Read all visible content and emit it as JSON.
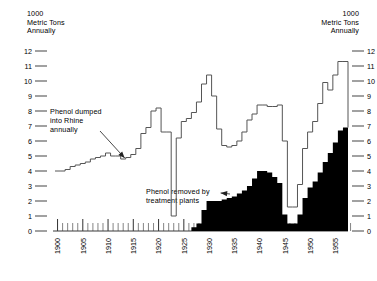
{
  "axis_caption_left": "1000\nMetric Tons\nAnnually",
  "axis_caption_right": "1000\nMetric Tons\nAnnually",
  "annotation_dumped": "Phenol dumped\ninto Rhine\nannually",
  "annotation_removed": "Phenol removed by\ntreatment plants",
  "colors": {
    "line": "#555555",
    "area_fill": "#000000",
    "text": "#000000",
    "tick": "#555555",
    "background": "#ffffff"
  },
  "chart_data": {
    "type": "area",
    "title": "",
    "subtitle": "",
    "xlabel": "",
    "ylabel": "1000 Metric Tons Annually",
    "xlim": [
      1900,
      1958
    ],
    "ylim": [
      0,
      12
    ],
    "grid": false,
    "legend": "none",
    "y_ticks": [
      12,
      11,
      10,
      9,
      8,
      7,
      6,
      5,
      4,
      3,
      2,
      1,
      0
    ],
    "y_tick_labels_left": [
      "12",
      "11",
      "10",
      "9",
      "8",
      "7",
      "6",
      "5",
      "4",
      "3",
      "2",
      "1",
      "0"
    ],
    "y_tick_labels_right": [
      "12",
      "11",
      "10",
      "9",
      "8",
      "7",
      "6",
      "5",
      "4",
      "3",
      "2",
      "1",
      "0"
    ],
    "x_ticks_major": [
      1900,
      1905,
      1910,
      1915,
      1920,
      1925,
      1930,
      1935,
      1940,
      1945,
      1950,
      1955
    ],
    "x_tick_labels": [
      "1900",
      "1905",
      "1910",
      "1915",
      "1920",
      "1925",
      "1930",
      "1935",
      "1940",
      "1945",
      "1950",
      "1955"
    ],
    "x_ticks_minor_step": 1,
    "annotations": [
      {
        "text": "Phenol dumped\ninto Rhine\nannually",
        "points_to_year": 1913,
        "points_to_value": 4.8
      },
      {
        "text": "Phenol removed by\ntreatment plants",
        "points_to_year": 1932,
        "points_to_value": 2.6
      }
    ],
    "x": [
      1900,
      1901,
      1902,
      1903,
      1904,
      1905,
      1906,
      1907,
      1908,
      1909,
      1910,
      1911,
      1912,
      1913,
      1914,
      1915,
      1916,
      1917,
      1918,
      1919,
      1920,
      1921,
      1922,
      1923,
      1924,
      1925,
      1926,
      1927,
      1928,
      1929,
      1930,
      1931,
      1932,
      1933,
      1934,
      1935,
      1936,
      1937,
      1938,
      1939,
      1940,
      1941,
      1942,
      1943,
      1944,
      1945,
      1946,
      1947,
      1948,
      1949,
      1950,
      1951,
      1952,
      1953,
      1954,
      1955,
      1956,
      1957
    ],
    "series": [
      {
        "name": "Phenol dumped into Rhine annually",
        "style": "step-line",
        "values": [
          4.0,
          4.0,
          4.1,
          4.3,
          4.4,
          4.5,
          4.6,
          4.8,
          4.9,
          5.0,
          5.2,
          5.0,
          5.0,
          4.8,
          4.9,
          5.1,
          5.5,
          6.5,
          6.9,
          8.0,
          8.2,
          6.6,
          6.6,
          1.0,
          6.2,
          7.3,
          7.5,
          7.9,
          8.6,
          9.8,
          10.4,
          9.0,
          6.8,
          5.7,
          5.6,
          5.7,
          6.0,
          6.6,
          7.4,
          7.8,
          8.4,
          8.4,
          8.3,
          8.3,
          8.4,
          6.0,
          1.6,
          1.6,
          3.1,
          5.5,
          6.6,
          7.3,
          8.5,
          9.9,
          9.4,
          10.4,
          11.3,
          11.3
        ]
      },
      {
        "name": "Phenol removed by treatment plants",
        "style": "step-area",
        "values": [
          0,
          0,
          0,
          0,
          0,
          0,
          0,
          0,
          0,
          0,
          0,
          0,
          0,
          0,
          0,
          0,
          0,
          0,
          0,
          0,
          0,
          0,
          0,
          0,
          0,
          0,
          0,
          0.25,
          0.5,
          1.4,
          2.0,
          2.0,
          2.0,
          2.1,
          2.2,
          2.3,
          2.5,
          2.7,
          3.0,
          3.5,
          4.0,
          4.0,
          3.9,
          3.6,
          3.2,
          1.1,
          0.5,
          0.5,
          1.1,
          2.2,
          2.9,
          3.3,
          3.9,
          4.6,
          5.2,
          5.9,
          6.7,
          6.9
        ]
      }
    ]
  }
}
